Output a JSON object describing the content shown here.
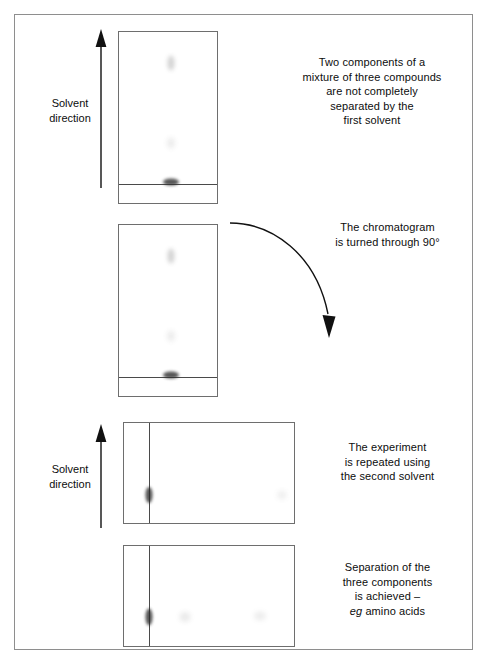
{
  "figure": {
    "type": "two-dimensional-paper-chromatography-diagram",
    "background_color": "#ffffff",
    "frame_color": "#8e8e8e",
    "ink_color": "#0d0d0d"
  },
  "labels": {
    "solvent_direction_top": "Solvent\ndirection",
    "solvent_direction_bottom": "Solvent\ndirection",
    "solvent_direction_line1": "Solvent",
    "solvent_direction_line2": "direction"
  },
  "captions": {
    "step1": "Two components of a\nmixture of three compounds\nare not completely\nseparated by the\nfirst solvent",
    "step1_lines": [
      "Two components of a",
      "mixture of three compounds",
      "are not completely",
      "separated by the",
      "first solvent"
    ],
    "step2": "The chromatogram\nis turned through 90°",
    "step2_lines": [
      "The chromatogram",
      "is turned through 90°"
    ],
    "step3": "The experiment\nis repeated using\nthe second solvent",
    "step3_lines": [
      "The experiment",
      "is repeated using",
      "the second solvent"
    ],
    "step4": "Separation of the\nthree components\nis achieved –\neg amino acids",
    "step4_lines": [
      "Separation of the",
      "three components",
      "is achieved –"
    ],
    "step4_italic_prefix": "eg",
    "step4_last_line_rest": " amino acids"
  },
  "plates": [
    {
      "name": "plate-1-first-solvent-run",
      "orientation": "portrait",
      "baseline": "horizontal",
      "spots": [
        {
          "name": "spot-component-a",
          "intensity": "faint",
          "opacity": 0.3
        },
        {
          "name": "spot-component-b",
          "intensity": "very-faint",
          "opacity": 0.13
        },
        {
          "name": "spot-origin-merged",
          "intensity": "dark",
          "opacity": 0.8
        }
      ]
    },
    {
      "name": "plate-2-before-rotation",
      "orientation": "portrait",
      "baseline": "horizontal",
      "spots": [
        {
          "name": "spot-component-a",
          "intensity": "faint",
          "opacity": 0.3
        },
        {
          "name": "spot-component-b",
          "intensity": "very-faint",
          "opacity": 0.13
        },
        {
          "name": "spot-origin-merged",
          "intensity": "dark",
          "opacity": 0.8
        }
      ]
    },
    {
      "name": "plate-3-rotated-second-solvent-start",
      "orientation": "landscape",
      "baseline": "vertical",
      "spots": [
        {
          "name": "spot-origin-merged",
          "intensity": "dark",
          "opacity": 0.8
        },
        {
          "name": "spot-component-b",
          "intensity": "very-faint",
          "opacity": 0.1
        }
      ]
    },
    {
      "name": "plate-4-fully-separated",
      "orientation": "landscape",
      "baseline": "vertical",
      "spots": [
        {
          "name": "spot-component-1",
          "intensity": "dark",
          "opacity": 0.8
        },
        {
          "name": "spot-component-2",
          "intensity": "very-faint",
          "opacity": 0.14
        },
        {
          "name": "spot-component-3",
          "intensity": "very-faint",
          "opacity": 0.12
        }
      ]
    }
  ],
  "arrows": {
    "solvent_arrow_top": "upward-arrow",
    "solvent_arrow_bottom": "upward-arrow",
    "rotation_arrow": "curved-arrow-clockwise-90"
  }
}
